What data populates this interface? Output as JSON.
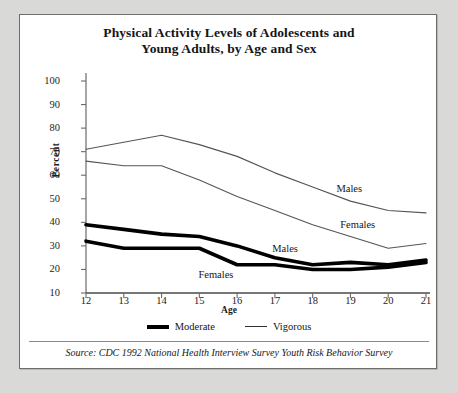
{
  "chart": {
    "title_line1": "Physical Activity Levels of Adolescents and",
    "title_line2": "Young Adults, by Age and Sex",
    "ylabel": "Percent",
    "xlabel": "Age",
    "source": "Source: CDC 1992 National Health Interview Survey Youth Risk Behavior Survey",
    "legend": {
      "moderate": "Moderate",
      "vigorous": "Vigorous"
    },
    "annotations": {
      "vigorous_males": "Males",
      "vigorous_females": "Females",
      "moderate_males": "Males",
      "moderate_females": "Females"
    }
  },
  "chart_data": {
    "type": "line",
    "title": "Physical Activity Levels of Adolescents and Young Adults, by Age and Sex",
    "xlabel": "Age",
    "ylabel": "Percent",
    "xlim": [
      12,
      21
    ],
    "ylim": [
      0,
      100
    ],
    "yticks": [
      10,
      20,
      30,
      40,
      50,
      60,
      70,
      80,
      90,
      100
    ],
    "xticks": [
      12,
      13,
      14,
      15,
      16,
      17,
      18,
      19,
      20,
      21
    ],
    "grid": false,
    "legend_position": "bottom",
    "x": [
      12,
      13,
      14,
      15,
      16,
      17,
      18,
      19,
      20,
      21
    ],
    "series": [
      {
        "name": "Vigorous Males",
        "activity": "Vigorous",
        "sex": "Males",
        "style": "thin",
        "values": [
          71,
          74,
          77,
          73,
          68,
          61,
          55,
          49,
          45,
          44
        ]
      },
      {
        "name": "Vigorous Females",
        "activity": "Vigorous",
        "sex": "Females",
        "style": "thin",
        "values": [
          66,
          64,
          64,
          58,
          51,
          45,
          39,
          34,
          29,
          31
        ]
      },
      {
        "name": "Moderate Males",
        "activity": "Moderate",
        "sex": "Males",
        "style": "thick",
        "values": [
          39,
          37,
          35,
          34,
          30,
          25,
          22,
          23,
          22,
          24
        ]
      },
      {
        "name": "Moderate Females",
        "activity": "Moderate",
        "sex": "Females",
        "style": "thick",
        "values": [
          32,
          29,
          29,
          29,
          22,
          22,
          20,
          20,
          21,
          23
        ]
      }
    ]
  }
}
